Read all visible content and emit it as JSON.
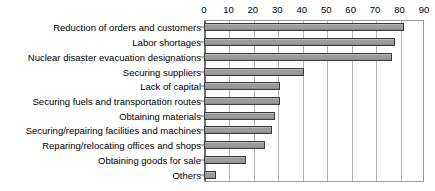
{
  "chart_data": {
    "type": "bar",
    "orientation": "horizontal",
    "title": "",
    "subtitle": "",
    "xlabel": "",
    "ylabel": "",
    "xlim": [
      0,
      90
    ],
    "xticks": [
      0,
      10,
      20,
      30,
      40,
      50,
      60,
      70,
      80,
      90
    ],
    "grid": true,
    "legend": false,
    "legend_position": "none",
    "categories": [
      "Reduction of orders and customers",
      "Labor shortages",
      "Nuclear disaster evacuation designations",
      "Securing suppliers",
      "Lack of capital",
      "Securing fuels and transportation routes",
      "Obtaining materials",
      "Securing/repairing facilities and machines",
      "Reparing/relocating offices and shops",
      "Obtaining goods for sale",
      "Others"
    ],
    "values": [
      82,
      78,
      77,
      41,
      31,
      31,
      29,
      28,
      25,
      17,
      5
    ],
    "colors": {
      "bar_fill": "#9b9b9b",
      "bar_border": "#3d3d3d",
      "gridline": "#b4b4b4",
      "axis": "#6f6f6f",
      "background": "#ffffff",
      "text": "#000000"
    }
  }
}
